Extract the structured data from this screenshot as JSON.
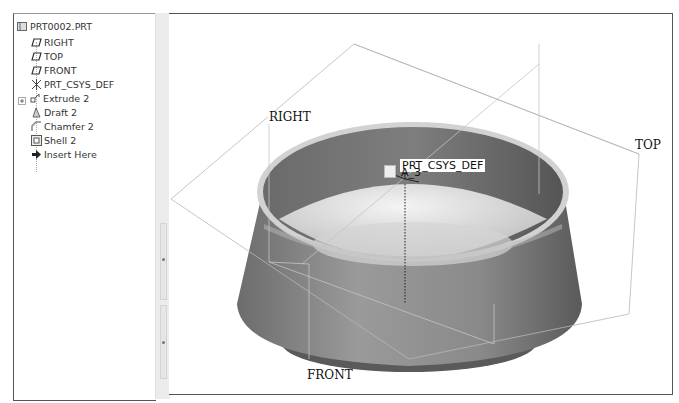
{
  "model_tree": {
    "root": {
      "label": "PRT0002.PRT",
      "icon": "part-icon"
    },
    "items": [
      {
        "label": "RIGHT",
        "icon": "datum-plane-icon"
      },
      {
        "label": "TOP",
        "icon": "datum-plane-icon"
      },
      {
        "label": "FRONT",
        "icon": "datum-plane-icon"
      },
      {
        "label": "PRT_CSYS_DEF",
        "icon": "coordinate-system-icon"
      },
      {
        "label": "Extrude 2",
        "icon": "extrude-icon",
        "expandable": true
      },
      {
        "label": "Draft 2",
        "icon": "draft-icon"
      },
      {
        "label": "Chamfer 2",
        "icon": "chamfer-icon"
      },
      {
        "label": "Shell 2",
        "icon": "shell-icon"
      },
      {
        "label": "Insert Here",
        "icon": "insert-arrow-icon"
      }
    ]
  },
  "viewport": {
    "datum_labels": {
      "right": "RIGHT",
      "top": "TOP",
      "front": "FRONT"
    },
    "csys_label": "PRT_CSYS_DEF",
    "axis_label": "A_3",
    "colors": {
      "shell_outer": "#8c8c8c",
      "shell_inner": "#6e6e6e",
      "rim": "#cfcfcf",
      "floor": "#d9d9d9",
      "datum_line": "#b0b0b0"
    }
  }
}
